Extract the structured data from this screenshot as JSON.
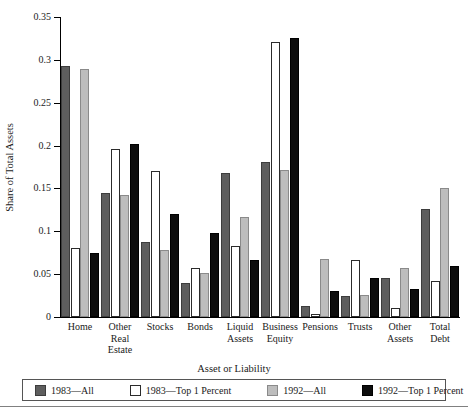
{
  "chart_data": {
    "type": "bar",
    "title": "",
    "xlabel": "Asset or Liability",
    "ylabel": "Share of Total Assets",
    "ylim": [
      0,
      0.35
    ],
    "yticks": [
      0,
      0.05,
      0.1,
      0.15,
      0.2,
      0.25,
      0.3,
      0.35
    ],
    "ytick_labels": [
      "0",
      "0.05",
      "0.1",
      "0.15",
      "0.2",
      "0.25",
      "0.3",
      "0.35"
    ],
    "grid": false,
    "legend_position": "bottom",
    "categories": [
      "Home",
      "Other Real Estate",
      "Stocks",
      "Bonds",
      "Liquid Assets",
      "Business Equity",
      "Pensions",
      "Trusts",
      "Other Assets",
      "Total Debt"
    ],
    "category_lines": [
      [
        "Home"
      ],
      [
        "Other",
        "Real",
        "Estate"
      ],
      [
        "Stocks"
      ],
      [
        "Bonds"
      ],
      [
        "Liquid",
        "Assets"
      ],
      [
        "Business",
        "Equity"
      ],
      [
        "Pensions"
      ],
      [
        "Trusts"
      ],
      [
        "Other",
        "Assets"
      ],
      [
        "Total",
        "Debt"
      ]
    ],
    "series": [
      {
        "name": "1983—All",
        "color": "#5e5e5e",
        "values": [
          0.293,
          0.145,
          0.088,
          0.04,
          0.168,
          0.181,
          0.013,
          0.025,
          0.046,
          0.126
        ]
      },
      {
        "name": "1983—Top 1 Percent",
        "color": "#ffffff",
        "values": [
          0.08,
          0.196,
          0.17,
          0.057,
          0.083,
          0.321,
          0.004,
          0.067,
          0.01,
          0.042
        ]
      },
      {
        "name": "1992—All",
        "color": "#bdbdbd",
        "values": [
          0.289,
          0.142,
          0.078,
          0.051,
          0.117,
          0.171,
          0.068,
          0.026,
          0.057,
          0.151
        ]
      },
      {
        "name": "1992—Top 1 Percent",
        "color": "#0d0d0d",
        "values": [
          0.075,
          0.202,
          0.12,
          0.098,
          0.067,
          0.326,
          0.03,
          0.046,
          0.033,
          0.06
        ]
      }
    ]
  }
}
